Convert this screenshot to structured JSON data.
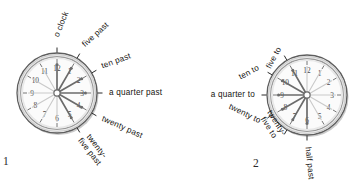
{
  "page": {
    "background_color": "#ffffff",
    "ink_color": "#15130f"
  },
  "figures": [
    {
      "number": "1",
      "caption": "1",
      "clock": {
        "name": "past-clock",
        "center_x": 57,
        "center_y": 93,
        "outer_radius": 40,
        "rim_color": "#8d8d8d",
        "face_color": "#fbfbfb",
        "hand_color": "#6b6b6b",
        "hour_numbers": [
          "12",
          "1",
          "2",
          "3",
          "4",
          "5",
          "6",
          "7",
          "8",
          "9",
          "10",
          "11"
        ]
      },
      "labels": [
        {
          "text": "o clock",
          "minute": 0,
          "angle_deg": -90,
          "radius": 56,
          "rotate": -68,
          "lines": 1
        },
        {
          "text": "five past",
          "minute": 5,
          "angle_deg": -60,
          "radius": 54,
          "rotate": -42,
          "lines": 1
        },
        {
          "text": "ten past",
          "minute": 10,
          "angle_deg": -30,
          "radius": 52,
          "rotate": -20,
          "lines": 1
        },
        {
          "text": "a quarter past",
          "minute": 15,
          "angle_deg": 0,
          "radius": 52,
          "rotate": 0,
          "lines": 1
        },
        {
          "text": "twenty past",
          "minute": 20,
          "angle_deg": 30,
          "radius": 52,
          "rotate": 24,
          "lines": 1
        },
        {
          "text": "twenty-five past",
          "minute": 25,
          "angle_deg": 60,
          "radius": 50,
          "rotate": 52,
          "lines": 2
        }
      ]
    },
    {
      "number": "2",
      "caption": "2",
      "clock": {
        "name": "to-clock",
        "center_x": 126,
        "center_y": 95,
        "outer_radius": 40,
        "rim_color": "#8d8d8d",
        "face_color": "#fbfbfb",
        "hand_color": "#6b6b6b",
        "hour_numbers": [
          "12",
          "1",
          "2",
          "3",
          "4",
          "5",
          "6",
          "7",
          "8",
          "9",
          "10",
          "11"
        ]
      },
      "labels": [
        {
          "text": "five to",
          "minute": 55,
          "angle_deg": -120,
          "radius": 54,
          "rotate": -62,
          "lines": 1
        },
        {
          "text": "ten to",
          "minute": 50,
          "angle_deg": -150,
          "radius": 55,
          "rotate": -28,
          "lines": 1
        },
        {
          "text": "a quarter to",
          "minute": 45,
          "angle_deg": 180,
          "radius": 52,
          "rotate": 0,
          "lines": 1
        },
        {
          "text": "twenty to",
          "minute": 40,
          "angle_deg": 150,
          "radius": 54,
          "rotate": 26,
          "lines": 1
        },
        {
          "text": "twenty-five to",
          "minute": 35,
          "angle_deg": 120,
          "radius": 52,
          "rotate": 58,
          "lines": 2
        },
        {
          "text": "half past",
          "minute": 30,
          "angle_deg": 90,
          "radius": 52,
          "rotate": 84,
          "lines": 1
        }
      ]
    }
  ]
}
